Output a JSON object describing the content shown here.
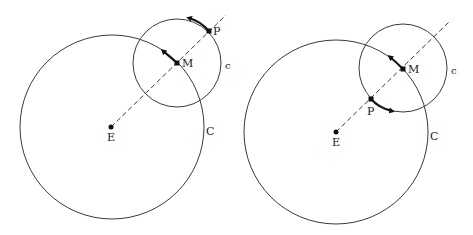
{
  "colors": {
    "stroke": "#3a3a3a",
    "ink": "#111111",
    "background": "#ffffff"
  },
  "figures": [
    {
      "name": "left",
      "labels": {
        "earth": "E",
        "center": "M",
        "planet": "P",
        "deferent": "C",
        "epicycle": "c"
      },
      "deferent": {
        "cx": 112,
        "cy": 127,
        "r": 92
      },
      "epicycle": {
        "cx": 177,
        "cy": 63,
        "r": 44
      },
      "points": {
        "E": [
          111,
          127
        ],
        "M": [
          177,
          63
        ],
        "P": [
          209,
          31
        ]
      },
      "dashed_line": {
        "from": [
          111,
          127
        ],
        "to": [
          226,
          15
        ]
      },
      "arrows": [
        "M moving along deferent counterclockwise",
        "P moving along epicycle counterclockwise"
      ]
    },
    {
      "name": "right",
      "labels": {
        "earth": "E",
        "center": "M",
        "planet": "P",
        "deferent": "C",
        "epicycle": "c"
      },
      "deferent": {
        "cx": 336,
        "cy": 132,
        "r": 92
      },
      "epicycle": {
        "cx": 403,
        "cy": 68,
        "r": 44
      },
      "points": {
        "E": [
          336,
          132
        ],
        "M": [
          403,
          69
        ],
        "P": [
          371,
          99
        ]
      },
      "dashed_line": {
        "from": [
          336,
          132
        ],
        "to": [
          449,
          22
        ]
      },
      "arrows": [
        "M moving along deferent counterclockwise",
        "P moving along epicycle counterclockwise (at inner position)"
      ]
    }
  ]
}
